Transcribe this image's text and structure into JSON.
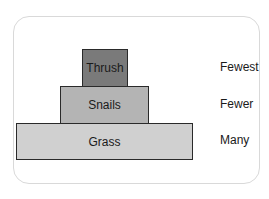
{
  "diagram": {
    "type": "pyramid of numbers",
    "levels": [
      {
        "name": "Thrush",
        "count_label": "Fewest",
        "color": "#7a7a7a"
      },
      {
        "name": "Snails",
        "count_label": "Fewer",
        "color": "#b4b4b4"
      },
      {
        "name": "Grass",
        "count_label": "Many",
        "color": "#d0d0d0"
      }
    ]
  }
}
